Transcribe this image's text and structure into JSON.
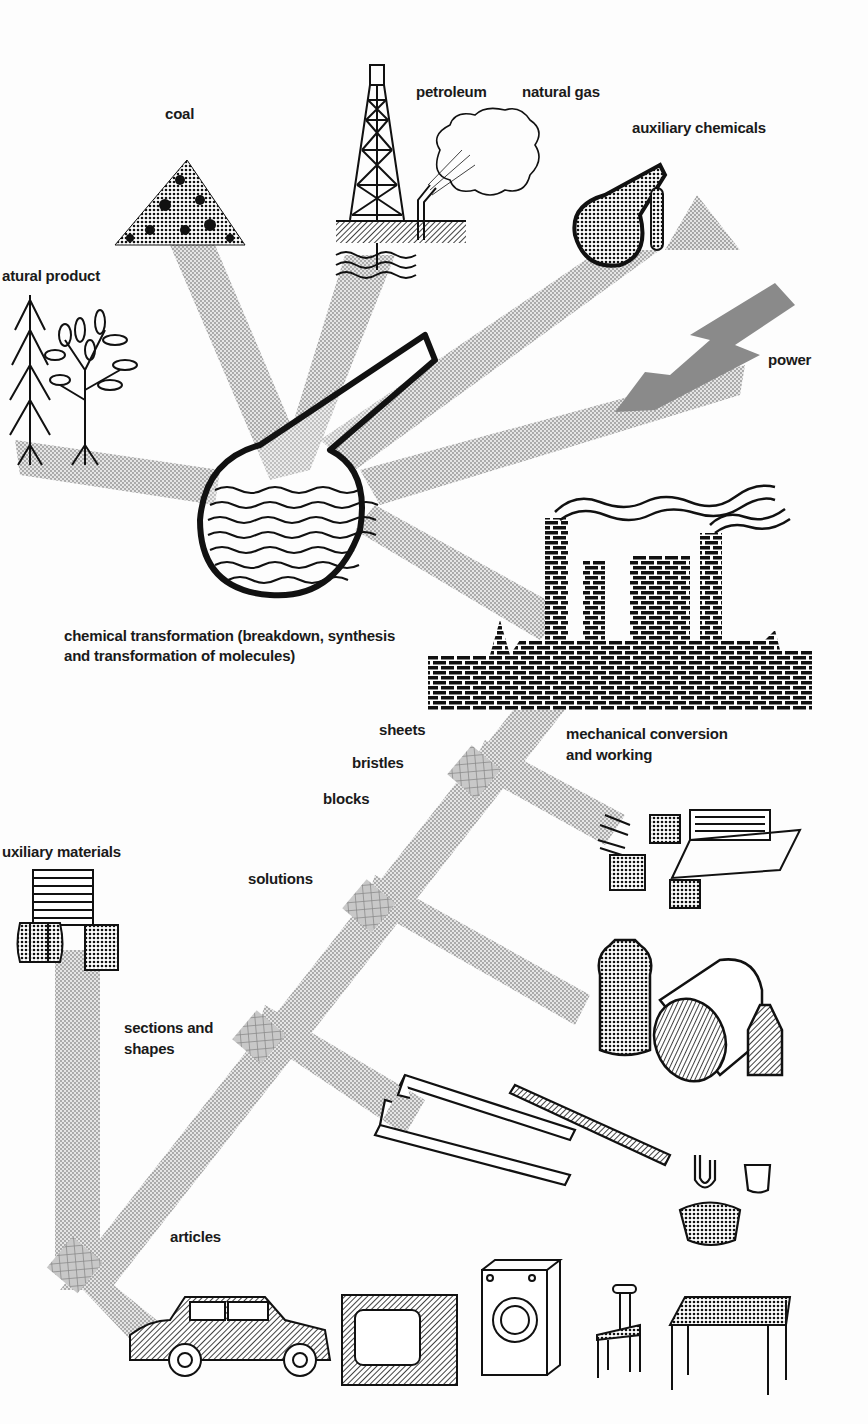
{
  "diagram": {
    "colors": {
      "stream": "#a8a8a8",
      "ink": "#111111",
      "power": "#8a8a8a",
      "background": "#fdfdfd"
    },
    "sources": {
      "natural_product": "atural product",
      "coal": "coal",
      "petroleum": "petroleum",
      "natural_gas": "natural gas",
      "auxiliary_chemicals": "auxiliary chemicals",
      "power": "power"
    },
    "process": {
      "chemical_line1": "chemical transformation (breakdown, synthesis",
      "chemical_line2": "and transformation of molecules)",
      "mechanical_line1": "mechanical conversion",
      "mechanical_line2": "and working"
    },
    "products": {
      "sheets": "sheets",
      "bristles": "bristles",
      "blocks": "blocks",
      "solutions": "solutions",
      "sections_line1": "sections and",
      "sections_line2": "shapes",
      "auxiliary_materials": "uxiliary materials",
      "articles": "articles"
    },
    "articles_icons": [
      "car-icon",
      "television-icon",
      "washing-machine-icon",
      "chair-icon",
      "table-icon"
    ]
  }
}
